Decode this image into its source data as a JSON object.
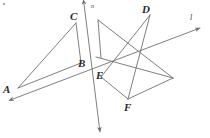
{
  "figure": {
    "type": "geometry-line-diagram",
    "width": 210,
    "height": 138,
    "background_color": "#ffffff",
    "stroke_color": "#6f6f76",
    "label_color": "#2b2b2b",
    "stroke_width": 0.9
  },
  "point_labels": [
    {
      "id": "C",
      "text": "C",
      "x": 70,
      "y": 11
    },
    {
      "id": "D",
      "text": "D",
      "x": 142,
      "y": 4
    },
    {
      "id": "B",
      "text": "B",
      "x": 78,
      "y": 58
    },
    {
      "id": "E",
      "text": "E",
      "x": 96,
      "y": 70
    },
    {
      "id": "A",
      "text": "A",
      "x": 3,
      "y": 84
    },
    {
      "id": "F",
      "text": "F",
      "x": 124,
      "y": 102
    }
  ],
  "line_labels": [
    {
      "id": "n",
      "text": "n",
      "x": 91,
      "y": 3,
      "size": "small"
    },
    {
      "id": "l",
      "text": "l",
      "x": 190,
      "y": 14,
      "size": "normal"
    }
  ],
  "vertices": {
    "A": [
      18,
      88
    ],
    "B": [
      81,
      63
    ],
    "C": [
      76,
      23
    ],
    "D": [
      150,
      15
    ],
    "E": [
      101,
      77
    ],
    "F": [
      128,
      99
    ],
    "G_top_left_wing": [
      98,
      20
    ],
    "H_right_apex": [
      173,
      78
    ],
    "I_left_mid": [
      96,
      57
    ]
  },
  "segments": [
    {
      "name": "segment-A-C",
      "from": [
        18,
        88
      ],
      "to": [
        76,
        23
      ]
    },
    {
      "name": "segment-C-B",
      "from": [
        76,
        23
      ],
      "to": [
        81,
        63
      ]
    },
    {
      "name": "segment-A-B",
      "from": [
        18,
        88
      ],
      "to": [
        81,
        63
      ]
    },
    {
      "name": "segment-G-down",
      "from": [
        98,
        20
      ],
      "to": [
        101,
        58
      ]
    },
    {
      "name": "segment-G-to-apex",
      "from": [
        98,
        20
      ],
      "to": [
        173,
        78
      ]
    },
    {
      "name": "segment-D-to-E",
      "from": [
        150,
        15
      ],
      "to": [
        101,
        77
      ]
    },
    {
      "name": "segment-D-down-left",
      "from": [
        150,
        15
      ],
      "to": [
        128,
        99
      ]
    },
    {
      "name": "segment-E-to-F",
      "from": [
        101,
        77
      ],
      "to": [
        128,
        99
      ]
    },
    {
      "name": "segment-F-to-apex",
      "from": [
        128,
        99
      ],
      "to": [
        173,
        78
      ]
    },
    {
      "name": "segment-midleft-to-apex",
      "from": [
        96,
        57
      ],
      "to": [
        173,
        78
      ]
    }
  ],
  "rays": [
    {
      "name": "ray-line-n",
      "from": [
        84,
        3
      ],
      "to": [
        100,
        133
      ],
      "arrow_start": true,
      "arrow_end": true
    },
    {
      "name": "ray-line-l",
      "from": [
        12,
        100
      ],
      "to": [
        201,
        28
      ],
      "arrow_start": true,
      "arrow_end": true
    }
  ],
  "decorations": [
    {
      "name": "corner-speck",
      "x": 3,
      "y": 3
    }
  ]
}
